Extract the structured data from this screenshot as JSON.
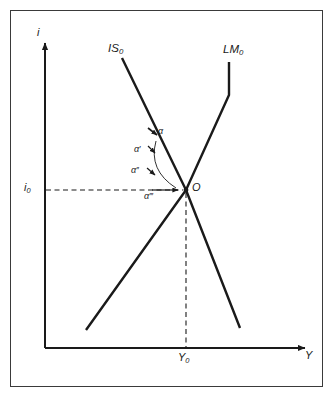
{
  "figure": {
    "type": "diagram",
    "axes": {
      "y_axis_label": "i",
      "x_axis_label": "Y",
      "y_tick_label": "i",
      "y_tick_sub": "0",
      "x_tick_label": "Y",
      "x_tick_sub": "0"
    },
    "curves": [
      {
        "name": "IS",
        "sub": "0",
        "label": "IS",
        "slope": "downward"
      },
      {
        "name": "LM",
        "sub": "0",
        "label": "LM",
        "slope": "upward"
      }
    ],
    "points": [
      {
        "name": "equilibrium",
        "label": "O"
      }
    ],
    "angles": [
      {
        "id": "alpha",
        "base": "α",
        "primes": ""
      },
      {
        "id": "alpha1",
        "base": "α",
        "primes": "′"
      },
      {
        "id": "alpha2",
        "base": "α",
        "primes": "′′"
      },
      {
        "id": "alpha3",
        "base": "α",
        "primes": "′′′"
      }
    ],
    "colors": {
      "curve": "#1a1a1a",
      "axis": "#1a1a1a",
      "dashed": "#1a1a1a",
      "border": "#3a3a3a",
      "background": "#ffffff"
    }
  }
}
